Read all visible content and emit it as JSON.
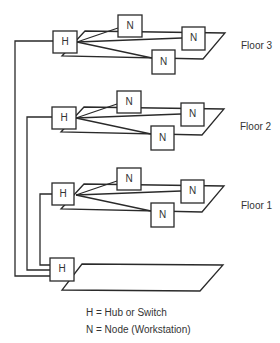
{
  "diagram": {
    "floors": [
      {
        "label": "Floor 3",
        "hub": "H",
        "nodes": [
          "N",
          "N",
          "N"
        ]
      },
      {
        "label": "Floor 2",
        "hub": "H",
        "nodes": [
          "N",
          "N",
          "N"
        ]
      },
      {
        "label": "Floor 1",
        "hub": "H",
        "nodes": [
          "N",
          "N",
          "N"
        ]
      }
    ],
    "basement": {
      "hub": "H"
    },
    "legend": {
      "hub": "H = Hub or Switch",
      "node": "N = Node (Workstation)"
    },
    "colors": {
      "line": "#2a2a2a",
      "text": "#333333",
      "background": "#ffffff"
    }
  }
}
